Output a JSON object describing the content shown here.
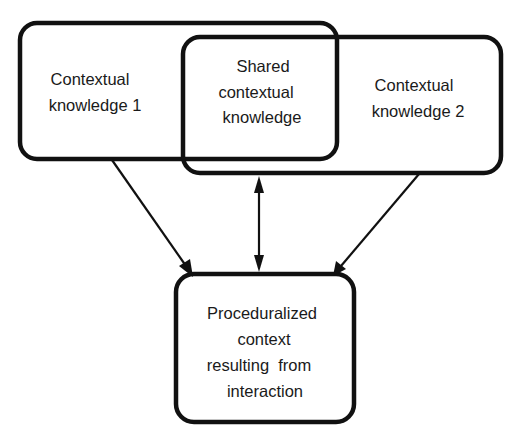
{
  "diagram": {
    "type": "overlapping-sets-flow",
    "colors": {
      "stroke": "#111111",
      "text": "#1a1a1a",
      "background": "#ffffff"
    },
    "nodes": {
      "contextual_knowledge_1": {
        "line1": "Contextual",
        "line2": "knowledge 1"
      },
      "shared": {
        "line1": "Shared",
        "line2": "contextual",
        "line3": "knowledge"
      },
      "contextual_knowledge_2": {
        "line1": "Contextual",
        "line2": "knowledge 2"
      },
      "proceduralized": {
        "line1": "Proceduralized",
        "line2": "context",
        "line3": "resulting  from",
        "line4": "interaction"
      }
    },
    "edges": [
      {
        "from": "contextual_knowledge_1",
        "to": "proceduralized",
        "direction": "one-way"
      },
      {
        "from": "shared",
        "to": "proceduralized",
        "direction": "two-way"
      },
      {
        "from": "contextual_knowledge_2",
        "to": "proceduralized",
        "direction": "one-way"
      }
    ]
  }
}
